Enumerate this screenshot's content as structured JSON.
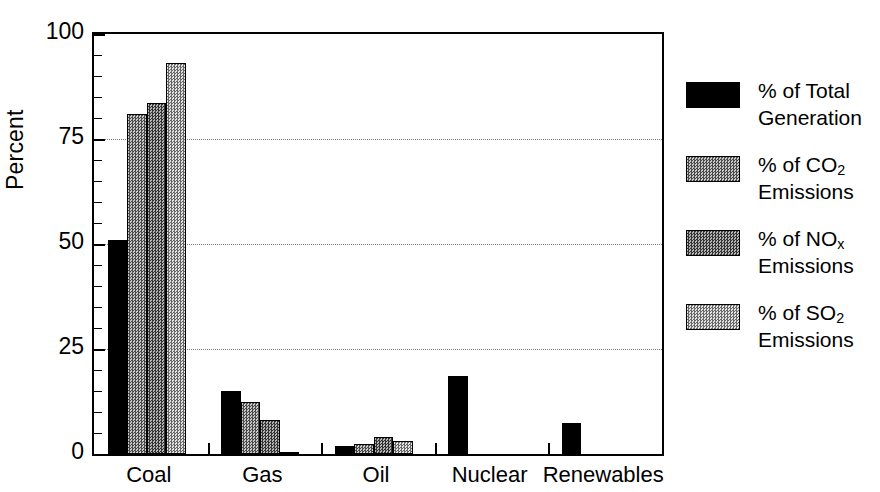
{
  "chart_data": {
    "type": "bar",
    "title": "",
    "xlabel": "",
    "ylabel": "Percent",
    "ylim": [
      0,
      100
    ],
    "yticks": [
      0,
      25,
      50,
      75,
      100
    ],
    "ytick_labels": [
      "0",
      "25",
      "50",
      "75",
      "100"
    ],
    "minor_tick_step": 5,
    "grid": "horizontal dotted gridlines at 25, 50, 75",
    "legend_position": "right",
    "categories": [
      "Coal",
      "Gas",
      "Oil",
      "Nuclear",
      "Renewables"
    ],
    "series": [
      {
        "name": "% of Total Generation",
        "fill": "solid-black",
        "color": "#000000",
        "values": [
          51,
          15,
          2,
          18.5,
          7.5
        ]
      },
      {
        "name": "% of CO2 Emissions",
        "fill": "medium-dither",
        "color": "#8d8d8d",
        "values": [
          81,
          12.5,
          2.5,
          0,
          0
        ]
      },
      {
        "name": "% of NOx Emissions",
        "fill": "dark-dither",
        "color": "#777777",
        "values": [
          83.5,
          8,
          4,
          0,
          0
        ]
      },
      {
        "name": "% of SO2 Emissions",
        "fill": "light-dither",
        "color": "#b3b3b3",
        "values": [
          93,
          0.5,
          3,
          0,
          0
        ]
      }
    ]
  },
  "legend": {
    "items": [
      {
        "line1": "% of Total",
        "line2": "Generation",
        "sub": "",
        "base": "% of Total",
        "swatch": "solid-black"
      },
      {
        "line1": "% of CO",
        "sub": "2",
        "line2": "Emissions",
        "swatch": "medium-dither"
      },
      {
        "line1": "% of NO",
        "sub": "x",
        "line2": "Emissions",
        "swatch": "dark-dither"
      },
      {
        "line1": "% of SO",
        "sub": "2",
        "line2": "Emissions",
        "swatch": "light-dither"
      }
    ]
  },
  "axes": {
    "ylabel": "Percent",
    "ytick_labels": [
      "100",
      "75",
      "50",
      "25",
      "0"
    ],
    "xtick_labels": [
      "Coal",
      "Gas",
      "Oil",
      "Nuclear",
      "Renewables"
    ]
  }
}
